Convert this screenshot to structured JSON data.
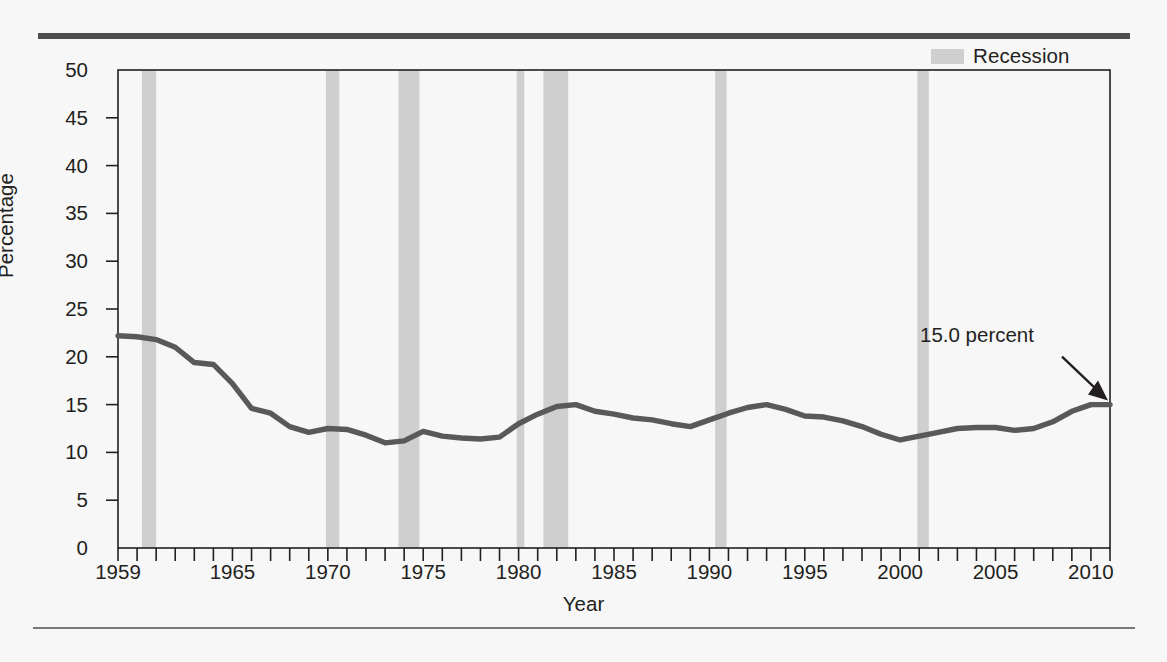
{
  "figure": {
    "legend_label": "Recession",
    "legend_swatch_color": "#cfcfcf",
    "line_color": "#58595b",
    "axis_color": "#231f20",
    "background": "#f7f7f7"
  },
  "chart_data": {
    "type": "line",
    "title": "",
    "xlabel": "Year",
    "ylabel": "Percentage",
    "xlim": [
      1959,
      2011
    ],
    "ylim": [
      0,
      50
    ],
    "grid": false,
    "legend_position": "top-right",
    "ytick_labels": [
      "0",
      "5",
      "10",
      "15",
      "20",
      "25",
      "30",
      "35",
      "40",
      "45",
      "50"
    ],
    "yticks": [
      0,
      5,
      10,
      15,
      20,
      25,
      30,
      35,
      40,
      45,
      50
    ],
    "xtick_labels": [
      "1959",
      "1965",
      "1970",
      "1975",
      "1980",
      "1985",
      "1990",
      "1995",
      "2000",
      "2005",
      "2010"
    ],
    "xticks": [
      1959,
      1965,
      1970,
      1975,
      1980,
      1985,
      1990,
      1995,
      2000,
      2005,
      2010
    ],
    "x_minor_tick_step": 1,
    "series": [
      {
        "name": "Percentage",
        "x": [
          1959,
          1960,
          1961,
          1962,
          1963,
          1964,
          1965,
          1966,
          1967,
          1968,
          1969,
          1970,
          1971,
          1972,
          1973,
          1974,
          1975,
          1976,
          1977,
          1978,
          1979,
          1980,
          1981,
          1982,
          1983,
          1984,
          1985,
          1986,
          1987,
          1988,
          1989,
          1990,
          1991,
          1992,
          1993,
          1994,
          1995,
          1996,
          1997,
          1998,
          1999,
          2000,
          2001,
          2002,
          2003,
          2004,
          2005,
          2006,
          2007,
          2008,
          2009,
          2010,
          2011
        ],
        "values": [
          22.2,
          22.1,
          21.8,
          21.0,
          19.4,
          19.2,
          17.2,
          14.6,
          14.1,
          12.7,
          12.1,
          12.5,
          12.4,
          11.8,
          11.0,
          11.2,
          12.2,
          11.7,
          11.5,
          11.4,
          11.6,
          13.0,
          14.0,
          14.8,
          15.0,
          14.3,
          14.0,
          13.6,
          13.4,
          13.0,
          12.7,
          13.4,
          14.1,
          14.7,
          15.0,
          14.5,
          13.8,
          13.7,
          13.3,
          12.7,
          11.9,
          11.3,
          11.7,
          12.1,
          12.5,
          12.6,
          12.6,
          12.3,
          12.5,
          13.2,
          14.3,
          15.0,
          15.0
        ]
      }
    ],
    "recession_bands": [
      {
        "start": 1960.25,
        "end": 1961.0
      },
      {
        "start": 1969.9,
        "end": 1970.6
      },
      {
        "start": 1973.7,
        "end": 1974.8
      },
      {
        "start": 1979.9,
        "end": 1980.3
      },
      {
        "start": 1981.3,
        "end": 1982.6
      },
      {
        "start": 1990.3,
        "end": 1990.9
      },
      {
        "start": 2000.9,
        "end": 2001.5
      }
    ],
    "annotations": [
      {
        "text": "15.0 percent",
        "value": 15.0,
        "year": 2011
      }
    ]
  }
}
